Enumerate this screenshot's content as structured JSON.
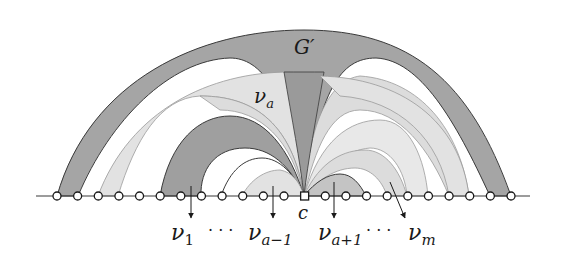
{
  "figure": {
    "labels": {
      "outer": "G′",
      "inner": "ν",
      "inner_sub": "a",
      "cut_vertex": "c",
      "bottom": [
        {
          "base": "ν",
          "sub": "1"
        },
        {
          "base": "",
          "sub": "",
          "text": "· · ·"
        },
        {
          "base": "ν",
          "sub": "a−1"
        },
        {
          "base": "ν",
          "sub": "a+1"
        },
        {
          "base": "",
          "sub": "",
          "text": "· · ·"
        },
        {
          "base": "ν",
          "sub": "m"
        }
      ]
    },
    "spine": {
      "vertex_count": 23,
      "cut_vertex_index": 12,
      "vertex_shape": "circle",
      "cut_vertex_shape": "square"
    },
    "colors": {
      "dark_fill": "#9a9a9a",
      "mid_fill": "#bdbdbd",
      "light_fill": "#dcdcdc",
      "lighter_fill": "#e6e6e6",
      "stroke": "#3a3a3a",
      "background": "#ffffff"
    }
  }
}
